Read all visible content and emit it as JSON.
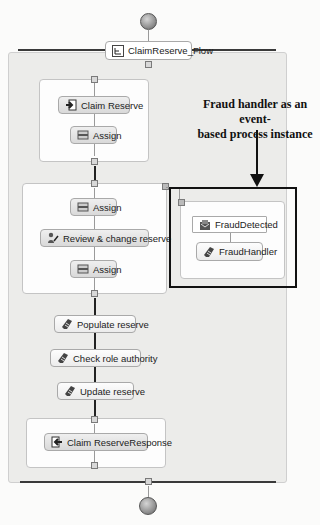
{
  "process": {
    "start_node": "start-event",
    "flow": {
      "label": "ClaimReserve_Flow",
      "icon": "flow-icon"
    },
    "end_node": "end-event"
  },
  "scopes": [
    {
      "name": "receive-scope",
      "nodes": [
        {
          "label": "Claim Reserve",
          "icon": "receive-icon"
        },
        {
          "label": "Assign",
          "icon": "assign-icon"
        }
      ]
    },
    {
      "name": "review-scope",
      "nodes": [
        {
          "label": "Assign",
          "icon": "assign-icon"
        },
        {
          "label": "Review & change reserve",
          "icon": "human-task-icon"
        },
        {
          "label": "Assign",
          "icon": "assign-icon"
        }
      ]
    },
    {
      "name": "reply-scope",
      "nodes": [
        {
          "label": "Claim ReserveResponse",
          "icon": "reply-icon"
        }
      ]
    }
  ],
  "invokes": [
    {
      "label": "Populate reserve",
      "icon": "invoke-icon"
    },
    {
      "label": "Check role authority",
      "icon": "invoke-icon"
    },
    {
      "label": "Update reserve",
      "icon": "invoke-icon"
    }
  ],
  "event_handler": {
    "event": {
      "label": "FraudDetected",
      "icon": "event-icon"
    },
    "handler": {
      "label": "FraudHandler",
      "icon": "invoke-icon"
    }
  },
  "annotation": {
    "line1": "Fraud handler as an event-",
    "line2": "based process instance"
  }
}
